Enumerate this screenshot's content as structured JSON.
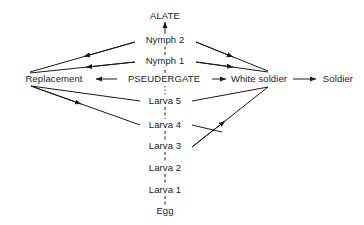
{
  "diagram": {
    "type": "caste-development-flow",
    "background_color": "#ffffff",
    "line_color": "#1a1a1a",
    "text_color": "#1a1a1a",
    "nodes": [
      {
        "id": "alate",
        "label": "ALATE",
        "x": 165,
        "y": 16
      },
      {
        "id": "nymph2",
        "label": "Nymph 2",
        "x": 165,
        "y": 40
      },
      {
        "id": "nymph1",
        "label": "Nymph 1",
        "x": 165,
        "y": 61
      },
      {
        "id": "replacement",
        "label": "Replacement",
        "x": 54,
        "y": 79
      },
      {
        "id": "pseudergate",
        "label": "PSEUDERGATE",
        "x": 164,
        "y": 79
      },
      {
        "id": "white_soldier",
        "label": "White soldier",
        "x": 259,
        "y": 79
      },
      {
        "id": "soldier",
        "label": "Soldier",
        "x": 338,
        "y": 79
      },
      {
        "id": "larva5",
        "label": "Larva 5",
        "x": 165,
        "y": 101
      },
      {
        "id": "larva4",
        "label": "Larva 4",
        "x": 165,
        "y": 125
      },
      {
        "id": "larva3",
        "label": "Larva 3",
        "x": 165,
        "y": 146
      },
      {
        "id": "larva2",
        "label": "Larva 2",
        "x": 165,
        "y": 168
      },
      {
        "id": "larva1",
        "label": "Larva 1",
        "x": 165,
        "y": 190
      },
      {
        "id": "egg",
        "label": "Egg",
        "x": 165,
        "y": 211
      }
    ],
    "edges": [
      {
        "id": "nymph2-alate",
        "from": "nymph2",
        "to": "alate",
        "style": "solid",
        "arrow": true
      },
      {
        "id": "nymph1-nymph2",
        "from": "nymph1",
        "to": "nymph2",
        "style": "dashed",
        "arrow": false
      },
      {
        "id": "pseudergate-nymph1",
        "from": "pseudergate",
        "to": "nymph1",
        "style": "dashed",
        "arrow": false
      },
      {
        "id": "nymph2-replacement",
        "from": "nymph2",
        "to": "replacement",
        "style": "solid",
        "arrow": true
      },
      {
        "id": "nymph1-replacement",
        "from": "nymph1",
        "to": "replacement",
        "style": "solid",
        "arrow": true
      },
      {
        "id": "nymph2-white-soldier",
        "from": "nymph2",
        "to": "white_soldier",
        "style": "solid",
        "arrow": true
      },
      {
        "id": "nymph1-white-soldier",
        "from": "nymph1",
        "to": "white_soldier",
        "style": "solid",
        "arrow": true
      },
      {
        "id": "pseudergate-replacement",
        "from": "pseudergate",
        "to": "replacement",
        "style": "solid",
        "arrow": true
      },
      {
        "id": "pseudergate-white-soldier",
        "from": "pseudergate",
        "to": "white_soldier",
        "style": "solid",
        "arrow": true
      },
      {
        "id": "white-soldier-soldier",
        "from": "white_soldier",
        "to": "soldier",
        "style": "solid",
        "arrow": true
      },
      {
        "id": "pseudergate-larva5",
        "from": "pseudergate",
        "to": "larva5",
        "style": "dotted",
        "arrow": false
      },
      {
        "id": "larva5-replacement",
        "from": "larva5",
        "to": "replacement",
        "style": "solid",
        "arrow": false
      },
      {
        "id": "larva4-replacement",
        "from": "larva4",
        "to": "replacement",
        "style": "solid",
        "arrow": true
      },
      {
        "id": "larva5-white-soldier",
        "from": "larva5",
        "to": "white_soldier",
        "style": "solid",
        "arrow": false
      },
      {
        "id": "larva3-white-soldier",
        "from": "larva3",
        "to": "white_soldier",
        "style": "solid",
        "arrow": true
      },
      {
        "id": "larva5-larva4",
        "from": "larva5",
        "to": "larva4",
        "style": "dashed",
        "arrow": false
      },
      {
        "id": "larva4-larva3",
        "from": "larva4",
        "to": "larva3",
        "style": "dashed",
        "arrow": false
      },
      {
        "id": "larva3-larva2",
        "from": "larva3",
        "to": "larva2",
        "style": "dashed",
        "arrow": false
      },
      {
        "id": "larva2-larva1",
        "from": "larva2",
        "to": "larva1",
        "style": "dashed",
        "arrow": false
      },
      {
        "id": "larva1-egg",
        "from": "larva1",
        "to": "egg",
        "style": "dashed",
        "arrow": false
      }
    ]
  }
}
